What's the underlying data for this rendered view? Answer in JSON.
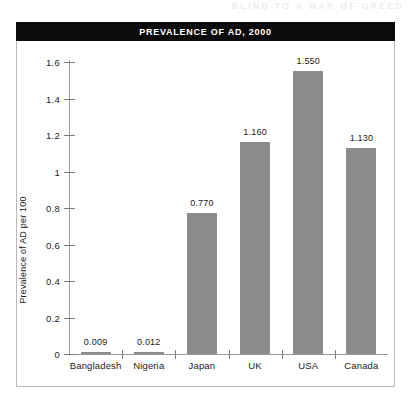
{
  "running_header": "BLIND TO A WAR OF GREED",
  "banner": {
    "title": "PREVALENCE OF AD, 2000"
  },
  "colors": {
    "bar": "#8c8c8c",
    "banner_background": "#0b0b0b",
    "banner_text": "#ffffff",
    "axis": "#9a9a9a",
    "frame": "#b9b9b9"
  },
  "chart_data": {
    "type": "bar",
    "title": "PREVALENCE OF AD, 2000",
    "xlabel": "",
    "ylabel": "Prevalence of AD per 100",
    "categories": [
      "Bangladesh",
      "Nigeria",
      "Japan",
      "UK",
      "USA",
      "Canada"
    ],
    "values": [
      0.009,
      0.012,
      0.77,
      1.16,
      1.55,
      1.13
    ],
    "value_labels": [
      "0.009",
      "0.012",
      "0.770",
      "1.160",
      "1.550",
      "1.130"
    ],
    "ylim": [
      0,
      1.6
    ],
    "yticks": [
      0,
      0.2,
      0.4,
      0.6,
      0.8,
      1,
      1.2,
      1.4,
      1.6
    ],
    "ytick_labels": [
      "0",
      "0.2",
      "0.4",
      "0.6",
      "0.8",
      "1",
      "1.2",
      "1.4",
      "1.6"
    ],
    "grid": false,
    "legend": false
  }
}
